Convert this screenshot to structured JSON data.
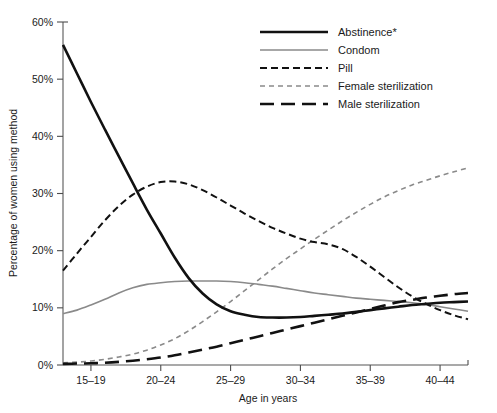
{
  "chart_data": {
    "type": "line",
    "title": "",
    "xlabel": "Age in years",
    "ylabel": "Percentage of women using method",
    "categories": [
      "15–19",
      "20–24",
      "25–29",
      "30–34",
      "35–39",
      "40–44"
    ],
    "x": [
      17,
      22,
      27,
      32,
      37,
      42
    ],
    "ylim": [
      0,
      60
    ],
    "xlim": [
      15,
      44
    ],
    "ytick_labels": [
      "0%",
      "10%",
      "20%",
      "30%",
      "40%",
      "50%",
      "60%"
    ],
    "ytick_values": [
      0,
      10,
      20,
      30,
      40,
      50,
      60
    ],
    "grid": false,
    "legend_position": "top-right",
    "series": [
      {
        "name": "Abstinence*",
        "style": "solid",
        "color": "#111111",
        "width": 2.6,
        "values": [
          56.0,
          25.5,
          10.2,
          8.4,
          9.3,
          11.0
        ],
        "points": [
          [
            15.0,
            56.0
          ],
          [
            16.0,
            51.0
          ],
          [
            17.0,
            46.0
          ],
          [
            18.0,
            41.2
          ],
          [
            19.0,
            36.5
          ],
          [
            20.0,
            31.8
          ],
          [
            21.0,
            27.2
          ],
          [
            22.0,
            23.0
          ],
          [
            23.0,
            18.8
          ],
          [
            24.0,
            15.2
          ],
          [
            25.0,
            12.5
          ],
          [
            26.0,
            10.6
          ],
          [
            27.0,
            9.4
          ],
          [
            28.0,
            8.8
          ],
          [
            29.0,
            8.4
          ],
          [
            30.0,
            8.3
          ],
          [
            31.0,
            8.3
          ],
          [
            32.0,
            8.4
          ],
          [
            33.0,
            8.6
          ],
          [
            34.0,
            8.8
          ],
          [
            35.0,
            9.0
          ],
          [
            36.0,
            9.3
          ],
          [
            37.0,
            9.6
          ],
          [
            38.0,
            9.9
          ],
          [
            39.0,
            10.2
          ],
          [
            40.0,
            10.5
          ],
          [
            41.0,
            10.7
          ],
          [
            42.0,
            10.9
          ],
          [
            43.0,
            11.0
          ],
          [
            44.0,
            11.1
          ]
        ]
      },
      {
        "name": "Condom",
        "style": "solid",
        "color": "#8a8a8a",
        "width": 1.6,
        "values": [
          9.0,
          14.3,
          14.6,
          13.2,
          11.6,
          9.5
        ],
        "points": [
          [
            15.0,
            9.0
          ],
          [
            16.0,
            9.6
          ],
          [
            17.0,
            10.5
          ],
          [
            18.0,
            11.5
          ],
          [
            19.0,
            12.6
          ],
          [
            20.0,
            13.5
          ],
          [
            21.0,
            14.1
          ],
          [
            22.0,
            14.4
          ],
          [
            23.0,
            14.6
          ],
          [
            24.0,
            14.7
          ],
          [
            25.0,
            14.7
          ],
          [
            26.0,
            14.7
          ],
          [
            27.0,
            14.6
          ],
          [
            28.0,
            14.4
          ],
          [
            29.0,
            14.1
          ],
          [
            30.0,
            13.8
          ],
          [
            31.0,
            13.4
          ],
          [
            32.0,
            13.0
          ],
          [
            33.0,
            12.6
          ],
          [
            34.0,
            12.3
          ],
          [
            35.0,
            12.0
          ],
          [
            36.0,
            11.7
          ],
          [
            37.0,
            11.5
          ],
          [
            38.0,
            11.3
          ],
          [
            39.0,
            11.1
          ],
          [
            40.0,
            10.9
          ],
          [
            41.0,
            10.6
          ],
          [
            42.0,
            10.2
          ],
          [
            43.0,
            9.8
          ],
          [
            44.0,
            9.4
          ]
        ]
      },
      {
        "name": "Pill",
        "style": "dashed",
        "color": "#111111",
        "width": 2.0,
        "values": [
          16.5,
          32.0,
          26.5,
          21.5,
          14.0,
          8.0
        ],
        "points": [
          [
            15.0,
            16.5
          ],
          [
            16.0,
            19.5
          ],
          [
            17.0,
            22.4
          ],
          [
            18.0,
            25.3
          ],
          [
            19.0,
            27.8
          ],
          [
            20.0,
            29.8
          ],
          [
            21.0,
            31.2
          ],
          [
            22.0,
            32.0
          ],
          [
            23.0,
            32.1
          ],
          [
            24.0,
            31.6
          ],
          [
            25.0,
            30.6
          ],
          [
            26.0,
            29.3
          ],
          [
            27.0,
            27.9
          ],
          [
            28.0,
            26.5
          ],
          [
            29.0,
            25.2
          ],
          [
            30.0,
            24.0
          ],
          [
            31.0,
            23.0
          ],
          [
            32.0,
            22.1
          ],
          [
            33.0,
            21.5
          ],
          [
            34.0,
            21.1
          ],
          [
            35.0,
            20.3
          ],
          [
            36.0,
            18.9
          ],
          [
            37.0,
            17.2
          ],
          [
            38.0,
            15.4
          ],
          [
            39.0,
            13.6
          ],
          [
            40.0,
            12.0
          ],
          [
            41.0,
            10.7
          ],
          [
            42.0,
            9.6
          ],
          [
            43.0,
            8.7
          ],
          [
            44.0,
            8.0
          ]
        ]
      },
      {
        "name": "Female sterilization",
        "style": "dashed-fine",
        "color": "#8a8a8a",
        "width": 1.6,
        "values": [
          0.5,
          2.0,
          9.5,
          20.0,
          29.0,
          34.5
        ],
        "points": [
          [
            15.0,
            0.4
          ],
          [
            16.0,
            0.5
          ],
          [
            17.0,
            0.7
          ],
          [
            18.0,
            1.0
          ],
          [
            19.0,
            1.4
          ],
          [
            20.0,
            1.9
          ],
          [
            21.0,
            2.6
          ],
          [
            22.0,
            3.5
          ],
          [
            23.0,
            4.6
          ],
          [
            24.0,
            6.0
          ],
          [
            25.0,
            7.6
          ],
          [
            26.0,
            9.3
          ],
          [
            27.0,
            11.1
          ],
          [
            28.0,
            13.0
          ],
          [
            29.0,
            14.9
          ],
          [
            30.0,
            16.8
          ],
          [
            31.0,
            18.6
          ],
          [
            32.0,
            20.3
          ],
          [
            33.0,
            22.0
          ],
          [
            34.0,
            23.6
          ],
          [
            35.0,
            25.2
          ],
          [
            36.0,
            26.7
          ],
          [
            37.0,
            28.1
          ],
          [
            38.0,
            29.4
          ],
          [
            39.0,
            30.5
          ],
          [
            40.0,
            31.5
          ],
          [
            41.0,
            32.3
          ],
          [
            42.0,
            33.1
          ],
          [
            43.0,
            33.8
          ],
          [
            44.0,
            34.5
          ]
        ]
      },
      {
        "name": "Male sterilization",
        "style": "long-dash",
        "color": "#111111",
        "width": 2.6,
        "values": [
          0.2,
          0.9,
          3.4,
          6.5,
          9.6,
          12.5
        ],
        "points": [
          [
            15.0,
            0.2
          ],
          [
            16.0,
            0.25
          ],
          [
            17.0,
            0.3
          ],
          [
            18.0,
            0.4
          ],
          [
            19.0,
            0.55
          ],
          [
            20.0,
            0.75
          ],
          [
            21.0,
            1.0
          ],
          [
            22.0,
            1.3
          ],
          [
            23.0,
            1.7
          ],
          [
            24.0,
            2.2
          ],
          [
            25.0,
            2.7
          ],
          [
            26.0,
            3.2
          ],
          [
            27.0,
            3.8
          ],
          [
            28.0,
            4.4
          ],
          [
            29.0,
            5.0
          ],
          [
            30.0,
            5.6
          ],
          [
            31.0,
            6.2
          ],
          [
            32.0,
            6.8
          ],
          [
            33.0,
            7.4
          ],
          [
            34.0,
            8.0
          ],
          [
            35.0,
            8.6
          ],
          [
            36.0,
            9.2
          ],
          [
            37.0,
            9.8
          ],
          [
            38.0,
            10.4
          ],
          [
            39.0,
            11.0
          ],
          [
            40.0,
            11.4
          ],
          [
            41.0,
            11.8
          ],
          [
            42.0,
            12.1
          ],
          [
            43.0,
            12.4
          ],
          [
            44.0,
            12.6
          ]
        ]
      }
    ]
  },
  "axes": {
    "y_label": "Percentage of women using method",
    "x_label": "Age in years",
    "y_ticks": [
      "60%",
      "50%",
      "40%",
      "30%",
      "20%",
      "10%",
      "0%"
    ],
    "x_ticks": [
      "15–19",
      "20–24",
      "25–29",
      "30–34",
      "35–39",
      "40–44"
    ]
  },
  "legend": {
    "items": [
      {
        "label": "Abstinence*",
        "swatch": "line-solid-thick-black"
      },
      {
        "label": "Condom",
        "swatch": "line-solid-thin-gray"
      },
      {
        "label": "Pill",
        "swatch": "line-dashed-black"
      },
      {
        "label": "Female sterilization",
        "swatch": "line-dashed-gray"
      },
      {
        "label": "Male sterilization",
        "swatch": "line-longdash-black"
      }
    ]
  },
  "colors": {
    "black": "#111111",
    "gray": "#8a8a8a",
    "axis": "#8c8c8c",
    "background": "#ffffff"
  }
}
